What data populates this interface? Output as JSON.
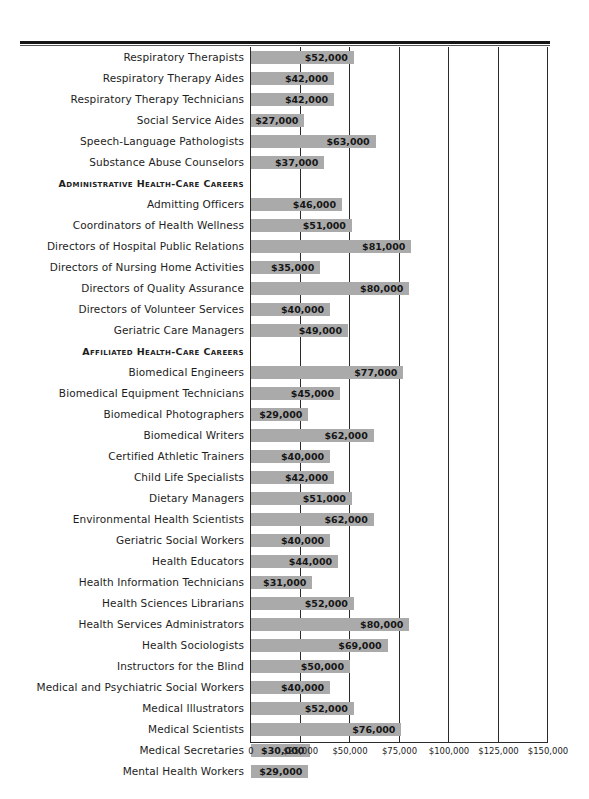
{
  "chart_data": {
    "type": "bar",
    "orientation": "horizontal",
    "title": "",
    "xlabel": "",
    "ylabel": "",
    "xlim": [
      0,
      150000
    ],
    "grid": true,
    "legend": false,
    "xticks": [
      "0",
      "$25,000",
      "$50,000",
      "$75,000",
      "$100,000",
      "$125,000",
      "$150,000"
    ],
    "xtick_values": [
      0,
      25000,
      50000,
      75000,
      100000,
      125000,
      150000
    ],
    "categories": [
      "Respiratory Therapists",
      "Respiratory Therapy Aides",
      "Respiratory Therapy Technicians",
      "Social Service Aides",
      "Speech-Language Pathologists",
      "Substance Abuse Counselors",
      "Admitting Officers",
      "Coordinators of Health Wellness",
      "Directors of Hospital Public Relations",
      "Directors of Nursing Home Activities",
      "Directors of Quality Assurance",
      "Directors of Volunteer Services",
      "Geriatric Care Managers",
      "Biomedical Engineers",
      "Biomedical Equipment Technicians",
      "Biomedical Photographers",
      "Biomedical Writers",
      "Certified Athletic Trainers",
      "Child Life Specialists",
      "Dietary Managers",
      "Environmental Health Scientists",
      "Geriatric Social Workers",
      "Health Educators",
      "Health Information Technicians",
      "Health Sciences Librarians",
      "Health Services Administrators",
      "Health Sociologists",
      "Instructors for the Blind",
      "Medical and Psychiatric Social Workers",
      "Medical Illustrators",
      "Medical Scientists",
      "Medical Secretaries",
      "Mental Health Workers"
    ],
    "values": [
      52000,
      42000,
      42000,
      27000,
      63000,
      37000,
      46000,
      51000,
      81000,
      35000,
      80000,
      40000,
      49000,
      77000,
      45000,
      29000,
      62000,
      40000,
      42000,
      51000,
      62000,
      40000,
      44000,
      31000,
      52000,
      80000,
      69000,
      50000,
      40000,
      52000,
      76000,
      30000,
      29000
    ],
    "value_labels": [
      "$52,000",
      "$42,000",
      "$42,000",
      "$27,000",
      "$63,000",
      "$37,000",
      "$46,000",
      "$51,000",
      "$81,000",
      "$35,000",
      "$80,000",
      "$40,000",
      "$49,000",
      "$77,000",
      "$45,000",
      "$29,000",
      "$62,000",
      "$40,000",
      "$42,000",
      "$51,000",
      "$62,000",
      "$40,000",
      "$44,000",
      "$31,000",
      "$52,000",
      "$80,000",
      "$69,000",
      "$50,000",
      "$40,000",
      "$52,000",
      "$76,000",
      "$30,000",
      "$29,000"
    ],
    "section_headers": [
      {
        "label": "Administrative Health-Care Careers",
        "before_category": "Admitting Officers"
      },
      {
        "label": "Affiliated Health-Care Careers",
        "before_category": "Biomedical Engineers"
      }
    ],
    "colors": {
      "bar": "#aaaaaa",
      "grid": "#2b2b2b",
      "text": "#1d1d1d",
      "rule": "#151515",
      "background": "#ffffff"
    }
  },
  "rows": [
    {
      "kind": "bar",
      "label": "Respiratory Therapists",
      "value": 52000,
      "value_label": "$52,000"
    },
    {
      "kind": "bar",
      "label": "Respiratory Therapy Aides",
      "value": 42000,
      "value_label": "$42,000"
    },
    {
      "kind": "bar",
      "label": "Respiratory Therapy Technicians",
      "value": 42000,
      "value_label": "$42,000"
    },
    {
      "kind": "bar",
      "label": "Social Service Aides",
      "value": 27000,
      "value_label": "$27,000"
    },
    {
      "kind": "bar",
      "label": "Speech-Language Pathologists",
      "value": 63000,
      "value_label": "$63,000"
    },
    {
      "kind": "bar",
      "label": "Substance Abuse Counselors",
      "value": 37000,
      "value_label": "$37,000"
    },
    {
      "kind": "section",
      "label": "Administrative Health-Care Careers"
    },
    {
      "kind": "bar",
      "label": "Admitting Officers",
      "value": 46000,
      "value_label": "$46,000"
    },
    {
      "kind": "bar",
      "label": "Coordinators of Health Wellness",
      "value": 51000,
      "value_label": "$51,000"
    },
    {
      "kind": "bar",
      "label": "Directors of Hospital Public Relations",
      "value": 81000,
      "value_label": "$81,000"
    },
    {
      "kind": "bar",
      "label": "Directors of Nursing Home Activities",
      "value": 35000,
      "value_label": "$35,000"
    },
    {
      "kind": "bar",
      "label": "Directors of Quality Assurance",
      "value": 80000,
      "value_label": "$80,000"
    },
    {
      "kind": "bar",
      "label": "Directors of Volunteer Services",
      "value": 40000,
      "value_label": "$40,000"
    },
    {
      "kind": "bar",
      "label": "Geriatric Care Managers",
      "value": 49000,
      "value_label": "$49,000"
    },
    {
      "kind": "section",
      "label": "Affiliated Health-Care Careers"
    },
    {
      "kind": "bar",
      "label": "Biomedical Engineers",
      "value": 77000,
      "value_label": "$77,000"
    },
    {
      "kind": "bar",
      "label": "Biomedical Equipment Technicians",
      "value": 45000,
      "value_label": "$45,000"
    },
    {
      "kind": "bar",
      "label": "Biomedical Photographers",
      "value": 29000,
      "value_label": "$29,000"
    },
    {
      "kind": "bar",
      "label": "Biomedical Writers",
      "value": 62000,
      "value_label": "$62,000"
    },
    {
      "kind": "bar",
      "label": "Certified Athletic Trainers",
      "value": 40000,
      "value_label": "$40,000"
    },
    {
      "kind": "bar",
      "label": "Child Life Specialists",
      "value": 42000,
      "value_label": "$42,000"
    },
    {
      "kind": "bar",
      "label": "Dietary Managers",
      "value": 51000,
      "value_label": "$51,000"
    },
    {
      "kind": "bar",
      "label": "Environmental Health Scientists",
      "value": 62000,
      "value_label": "$62,000"
    },
    {
      "kind": "bar",
      "label": "Geriatric Social Workers",
      "value": 40000,
      "value_label": "$40,000"
    },
    {
      "kind": "bar",
      "label": "Health Educators",
      "value": 44000,
      "value_label": "$44,000"
    },
    {
      "kind": "bar",
      "label": "Health Information Technicians",
      "value": 31000,
      "value_label": "$31,000"
    },
    {
      "kind": "bar",
      "label": "Health Sciences Librarians",
      "value": 52000,
      "value_label": "$52,000"
    },
    {
      "kind": "bar",
      "label": "Health Services Administrators",
      "value": 80000,
      "value_label": "$80,000"
    },
    {
      "kind": "bar",
      "label": "Health Sociologists",
      "value": 69000,
      "value_label": "$69,000"
    },
    {
      "kind": "bar",
      "label": "Instructors for the Blind",
      "value": 50000,
      "value_label": "$50,000"
    },
    {
      "kind": "bar",
      "label": "Medical and Psychiatric Social Workers",
      "value": 40000,
      "value_label": "$40,000"
    },
    {
      "kind": "bar",
      "label": "Medical Illustrators",
      "value": 52000,
      "value_label": "$52,000"
    },
    {
      "kind": "bar",
      "label": "Medical Scientists",
      "value": 76000,
      "value_label": "$76,000"
    },
    {
      "kind": "bar",
      "label": "Medical Secretaries",
      "value": 30000,
      "value_label": "$30,000"
    },
    {
      "kind": "bar",
      "label": "Mental Health Workers",
      "value": 29000,
      "value_label": "$29,000"
    }
  ]
}
